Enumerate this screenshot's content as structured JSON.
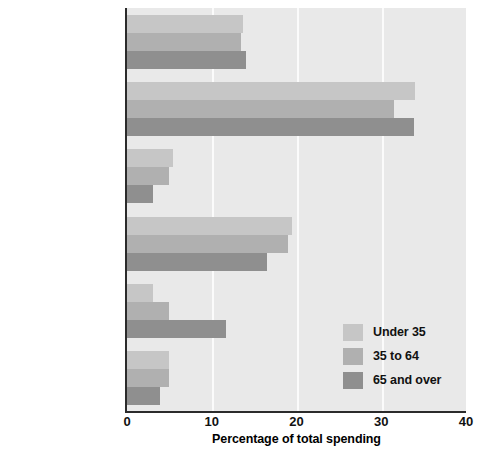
{
  "chart_data": {
    "type": "bar",
    "orientation": "horizontal",
    "title": "",
    "xlabel": "Percentage of total spending",
    "ylabel": "",
    "xlim": [
      0,
      40
    ],
    "xticks": [
      0,
      10,
      20,
      30,
      40
    ],
    "xtick_labels": [
      "0",
      "10",
      "20",
      "30",
      "40"
    ],
    "grid": true,
    "grid_axis": "x",
    "legend_position": "lower right",
    "categories": [
      "Food",
      "Housing",
      "Apparel and services",
      "Transportation",
      "Health care",
      "Entertainment"
    ],
    "series": [
      {
        "name": "Under 35",
        "color": "#c6c6c6",
        "values": [
          13.7,
          34.0,
          5.4,
          19.5,
          3.1,
          5.0
        ]
      },
      {
        "name": "35 to 64",
        "color": "#b0b0b0",
        "values": [
          13.5,
          31.5,
          4.9,
          19.0,
          4.9,
          5.0
        ]
      },
      {
        "name": "65 and over",
        "color": "#8f8f8f",
        "values": [
          14.1,
          33.9,
          3.1,
          16.5,
          11.7,
          3.9
        ]
      }
    ]
  },
  "legend": {
    "entries": [
      {
        "label": "Under 35"
      },
      {
        "label": "35 to 64"
      },
      {
        "label": "65 and over"
      }
    ]
  },
  "axes": {
    "x_title": "Percentage of total spending"
  }
}
